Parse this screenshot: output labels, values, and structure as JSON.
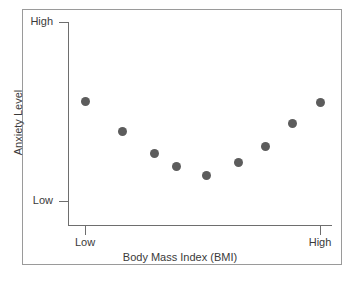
{
  "chart_data": {
    "type": "scatter",
    "title": "",
    "subtitle": "",
    "xlabel": "Body Mass Index (BMI)",
    "ylabel": "Anxiety Level",
    "x_tick_labels": [
      "Low",
      "High"
    ],
    "y_tick_labels": [
      "Low",
      "High"
    ],
    "xlim": [
      "Low",
      "High"
    ],
    "ylim": [
      "Low",
      "High"
    ],
    "grid": false,
    "legend": null,
    "annotations": [],
    "series": [
      {
        "name": "BMI vs Anxiety",
        "marker": "filled-circle",
        "color": "#5c5c5c",
        "points": [
          {
            "index": 1,
            "x_px": 85,
            "y_px": 101,
            "x_rel": 0.07,
            "y_rel": 0.62
          },
          {
            "index": 2,
            "x_px": 122,
            "y_px": 131,
            "x_rel": 0.2,
            "y_rel": 0.47
          },
          {
            "index": 3,
            "x_px": 154,
            "y_px": 153,
            "x_rel": 0.33,
            "y_rel": 0.35
          },
          {
            "index": 4,
            "x_px": 176,
            "y_px": 166,
            "x_rel": 0.43,
            "y_rel": 0.29
          },
          {
            "index": 5,
            "x_px": 206,
            "y_px": 175,
            "x_rel": 0.56,
            "y_rel": 0.24
          },
          {
            "index": 6,
            "x_px": 238,
            "y_px": 162,
            "x_rel": 0.7,
            "y_rel": 0.31
          },
          {
            "index": 7,
            "x_px": 265,
            "y_px": 146,
            "x_rel": 0.81,
            "y_rel": 0.39
          },
          {
            "index": 8,
            "x_px": 292,
            "y_px": 123,
            "x_rel": 0.92,
            "y_rel": 0.51
          },
          {
            "index": 9,
            "x_px": 320,
            "y_px": 102,
            "x_rel": 1.0,
            "y_rel": 0.61
          }
        ]
      }
    ]
  },
  "axes": {
    "y": {
      "title": "Anxiety Level",
      "ticks": [
        {
          "name": "high",
          "label": "High"
        },
        {
          "name": "low",
          "label": "Low"
        }
      ]
    },
    "x": {
      "title": "Body Mass Index (BMI)",
      "ticks": [
        {
          "name": "low",
          "label": "Low"
        },
        {
          "name": "high",
          "label": "High"
        }
      ]
    }
  },
  "colors": {
    "marker": "#5c5c5c",
    "axis": "#6e6e6e",
    "frame": "#9a9a9a",
    "text": "#3a3a3a",
    "background": "#ffffff"
  }
}
